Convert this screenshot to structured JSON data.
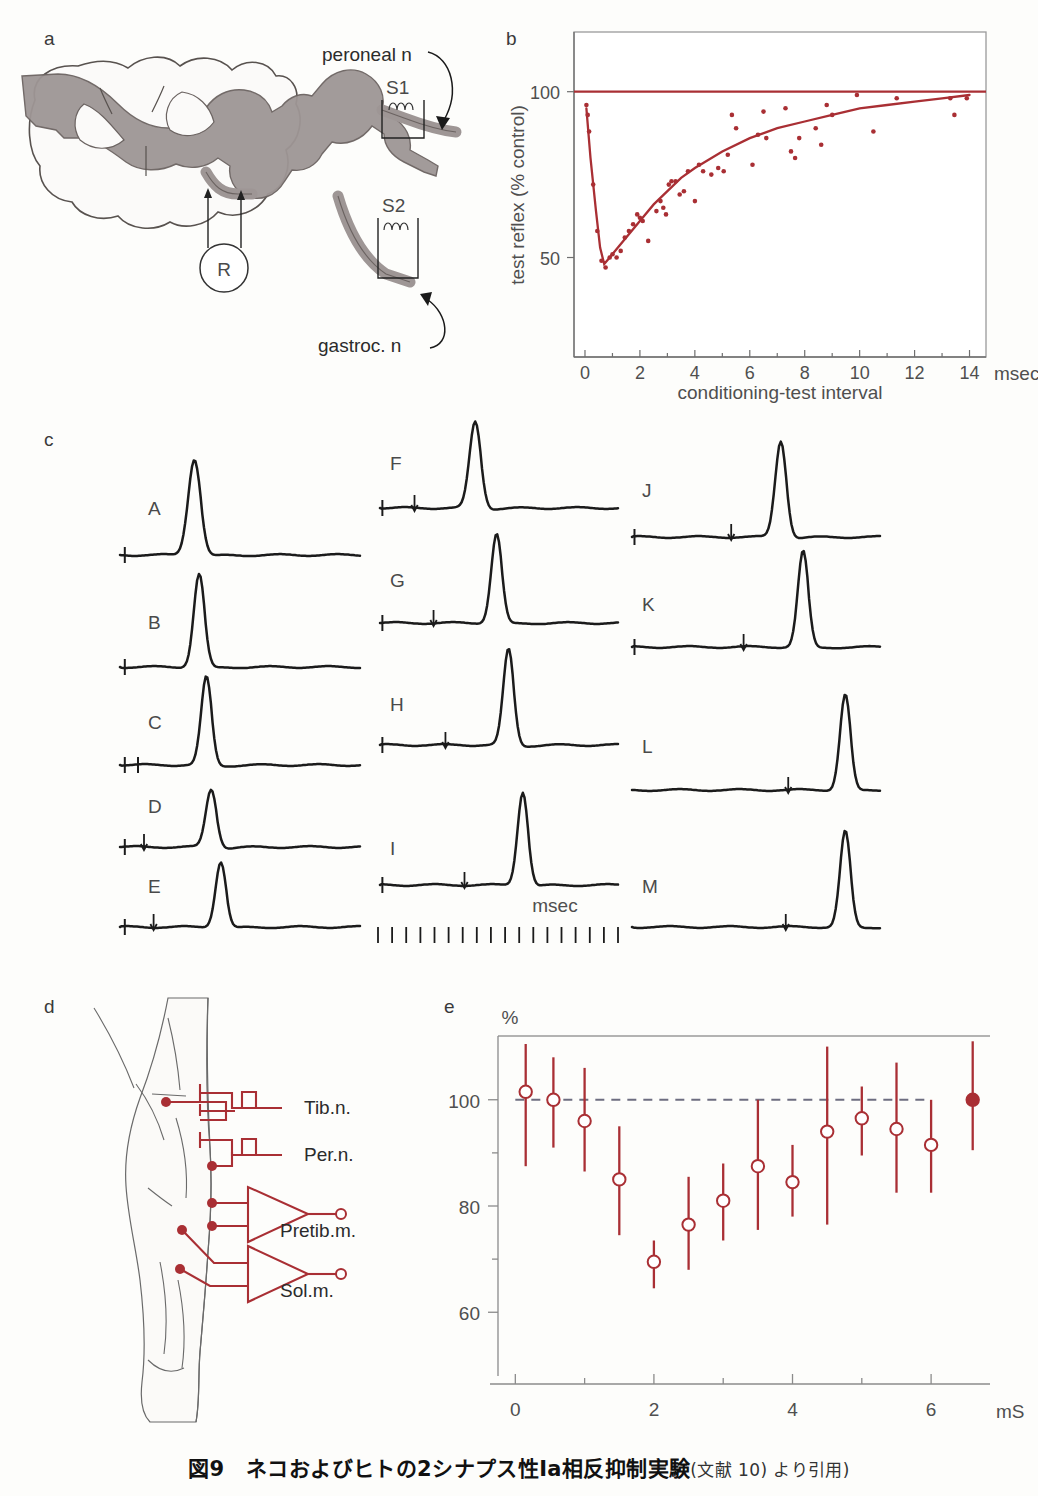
{
  "figure": {
    "caption_title": "図9　ネコおよびヒトの2シナプス性Ia相反抑制実験",
    "caption_source": "(文献 10) より引用)",
    "panel_labels": {
      "a": "a",
      "b": "b",
      "c": "c",
      "d": "d",
      "e": "e"
    },
    "accent_red": "#a92f34",
    "cord_grey": "#9e9695",
    "trace_black": "#1b1b1b"
  },
  "panel_a": {
    "label": "a",
    "annotations": {
      "peroneal": "peroneal n",
      "gastroc": "gastroc. n",
      "s1": "S1",
      "s2": "S2",
      "recorder": "R"
    }
  },
  "panel_b": {
    "label": "b",
    "chart_data": {
      "type": "scatter",
      "title": "",
      "xlabel": "conditioning-test interval",
      "ylabel": "test reflex (% control)",
      "xunit": "msec",
      "xlim": [
        -0.4,
        14.6
      ],
      "ylim": [
        20,
        118
      ],
      "xticks": [
        0,
        1,
        2,
        3,
        4,
        5,
        6,
        7,
        8,
        9,
        10,
        11,
        12,
        13,
        14
      ],
      "xticklabels": [
        "0",
        "",
        "2",
        "",
        "4",
        "",
        "6",
        "",
        "8",
        "",
        "10",
        "",
        "12",
        "",
        "14"
      ],
      "yticks": [
        50,
        100
      ],
      "yticklabels": [
        "50",
        "100"
      ],
      "grid": false,
      "reference_line": {
        "y": 100,
        "label": "100% control"
      },
      "series": [
        {
          "name": "test reflex data points",
          "x": [
            0.05,
            0.1,
            0.15,
            0.3,
            0.45,
            0.6,
            0.75,
            0.9,
            1.0,
            1.15,
            1.3,
            1.45,
            1.6,
            1.75,
            1.9,
            2.0,
            2.1,
            2.3,
            2.6,
            2.75,
            2.85,
            2.95,
            3.05,
            3.15,
            3.3,
            3.45,
            3.6,
            3.75,
            4.0,
            4.15,
            4.3,
            4.6,
            4.85,
            5.05,
            5.2,
            5.35,
            5.5,
            6.1,
            6.3,
            6.5,
            6.6,
            7.3,
            7.5,
            7.65,
            7.8,
            8.4,
            8.6,
            8.8,
            9.0,
            9.9,
            10.5,
            11.35,
            13.3,
            13.45,
            13.9
          ],
          "y": [
            96,
            93,
            88,
            72,
            58,
            49,
            47,
            50,
            51,
            50,
            52,
            56,
            58,
            60,
            63,
            62,
            61,
            55,
            64,
            67,
            65,
            63,
            72,
            73,
            73,
            69,
            70,
            76,
            67,
            78,
            76,
            75,
            77,
            76,
            81,
            93,
            89,
            78,
            87,
            94,
            86,
            95,
            82,
            80,
            86,
            89,
            84,
            96,
            93,
            99,
            88,
            98,
            98,
            93,
            98
          ]
        }
      ],
      "fit_curve": {
        "name": "recovery curve",
        "description": "sharp dip to ~48% near 0.7 ms then exponential recovery toward 100%",
        "points_x": [
          0.05,
          0.2,
          0.4,
          0.55,
          0.7,
          0.9,
          1.2,
          1.6,
          2.0,
          2.5,
          3.0,
          3.5,
          4.0,
          5.0,
          6.0,
          7.0,
          8.0,
          9.0,
          10.0,
          11.0,
          12.0,
          13.0,
          14.0
        ],
        "points_y": [
          95,
          80,
          64,
          53,
          48,
          50,
          53,
          57,
          61,
          66,
          70,
          74,
          77,
          82,
          86,
          89,
          91,
          93,
          95,
          96,
          97,
          98,
          99
        ]
      }
    }
  },
  "panel_c": {
    "label": "c",
    "time_label": "msec",
    "columns": [
      {
        "traces": [
          {
            "id": "A",
            "peak_x": 0.31,
            "peak_h": 1.0,
            "peak_w": 0.035,
            "stim_marks": [
              0.02
            ],
            "arrows": []
          },
          {
            "id": "B",
            "peak_x": 0.33,
            "peak_h": 0.97,
            "peak_w": 0.03,
            "stim_marks": [
              0.02
            ],
            "arrows": []
          },
          {
            "id": "C",
            "peak_x": 0.36,
            "peak_h": 0.92,
            "peak_w": 0.028,
            "stim_marks": [
              0.02,
              0.075
            ],
            "arrows": []
          },
          {
            "id": "D",
            "peak_x": 0.38,
            "peak_h": 0.6,
            "peak_w": 0.03,
            "stim_marks": [
              0.02
            ],
            "arrows": [
              0.1
            ]
          },
          {
            "id": "E",
            "peak_x": 0.42,
            "peak_h": 0.68,
            "peak_w": 0.028,
            "stim_marks": [
              0.02
            ],
            "arrows": [
              0.14
            ]
          }
        ]
      },
      {
        "traces": [
          {
            "id": "F",
            "peak_x": 0.4,
            "peak_h": 0.9,
            "peak_w": 0.032,
            "stim_marks": [
              0.01
            ],
            "arrows": [
              0.145
            ]
          },
          {
            "id": "G",
            "peak_x": 0.49,
            "peak_h": 0.93,
            "peak_w": 0.03,
            "stim_marks": [
              0.01
            ],
            "arrows": [
              0.225
            ]
          },
          {
            "id": "H",
            "peak_x": 0.54,
            "peak_h": 1.0,
            "peak_w": 0.028,
            "stim_marks": [
              0.01
            ],
            "arrows": [
              0.275
            ]
          },
          {
            "id": "I",
            "peak_x": 0.6,
            "peak_h": 0.97,
            "peak_w": 0.026,
            "stim_marks": [
              0.01
            ],
            "arrows": [
              0.355
            ]
          }
        ]
      },
      {
        "traces": [
          {
            "id": "J",
            "peak_x": 0.6,
            "peak_h": 1.0,
            "peak_w": 0.03,
            "stim_marks": [
              0.01
            ],
            "arrows": [
              0.4
            ]
          },
          {
            "id": "K",
            "peak_x": 0.69,
            "peak_h": 1.0,
            "peak_w": 0.028,
            "stim_marks": [
              0.01
            ],
            "arrows": [
              0.45
            ]
          },
          {
            "id": "L",
            "peak_x": 0.86,
            "peak_h": 1.0,
            "peak_w": 0.026,
            "stim_marks": [],
            "arrows": [
              0.63
            ]
          },
          {
            "id": "M",
            "peak_x": 0.86,
            "peak_h": 1.0,
            "peak_w": 0.026,
            "stim_marks": [],
            "arrows": [
              0.62
            ]
          }
        ]
      }
    ],
    "scalebar_ticks": 18
  },
  "panel_d": {
    "label": "d",
    "annotations": {
      "tib": "Tib.n.",
      "per": "Per.n.",
      "pretib": "Pretib.m.",
      "sol": "Sol.m."
    }
  },
  "panel_e": {
    "label": "e",
    "chart_data": {
      "type": "scatter",
      "title": "",
      "xlabel": "",
      "ylabel": "%",
      "xunit": "mS",
      "xlim": [
        -0.25,
        6.85
      ],
      "ylim": [
        48,
        112
      ],
      "xticks": [
        0,
        1,
        2,
        3,
        4,
        5,
        6
      ],
      "xticklabels": [
        "0",
        "",
        "2",
        "",
        "4",
        "",
        "6"
      ],
      "yticks": [
        60,
        70,
        80,
        90,
        100
      ],
      "yticklabels": [
        "60",
        "",
        "80",
        "",
        "100"
      ],
      "grid": false,
      "reference_line": {
        "y": 100,
        "style": "dashed",
        "x_from": 0,
        "x_to": 6.0
      },
      "series": [
        {
          "name": "conditioned H-reflex (% control)",
          "marker": "open-circle",
          "x": [
            0.15,
            0.55,
            1.0,
            1.5,
            2.0,
            2.5,
            3.0,
            3.5,
            4.0,
            4.5,
            5.0,
            5.5,
            6.0
          ],
          "y": [
            101.5,
            100.0,
            96.0,
            85.0,
            69.5,
            76.5,
            81.0,
            87.5,
            84.5,
            94.0,
            96.5,
            94.5,
            91.5
          ],
          "err_hi": [
            110.5,
            108.0,
            106.0,
            95.0,
            73.5,
            85.5,
            88.0,
            100.0,
            91.5,
            110.0,
            102.5,
            107.0,
            100.0
          ],
          "err_lo": [
            87.5,
            91.0,
            86.5,
            74.5,
            64.5,
            68.0,
            73.5,
            75.5,
            78.0,
            76.5,
            89.5,
            82.5,
            82.5
          ]
        },
        {
          "name": "control (filled)",
          "marker": "filled-circle",
          "x": [
            6.6
          ],
          "y": [
            100.0
          ],
          "err_hi": [
            111.0
          ],
          "err_lo": [
            90.5
          ]
        }
      ]
    }
  }
}
